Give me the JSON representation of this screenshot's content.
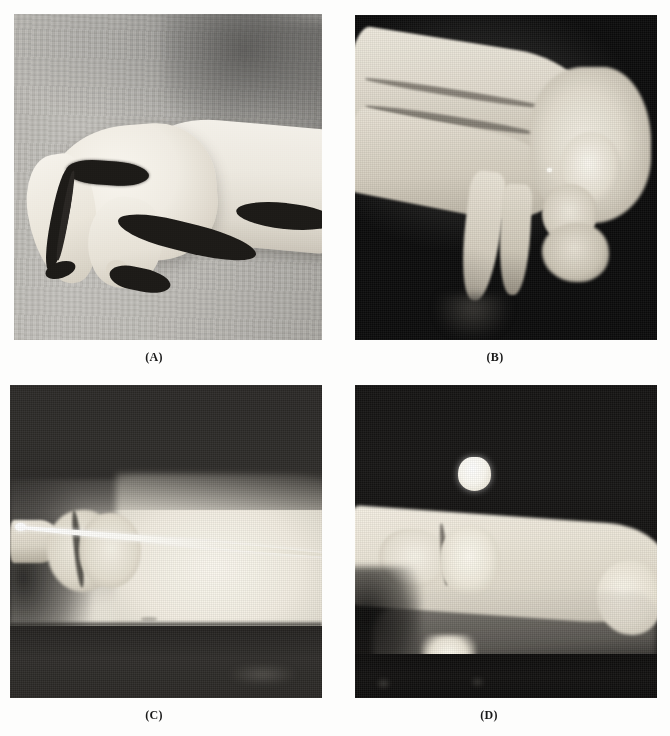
{
  "figure": {
    "background_color": "#fdfdfc",
    "layout": "2x2 panel grid",
    "panels": [
      {
        "id": "a",
        "label": "(A)",
        "kind": "clinical-photograph",
        "description": "Lateral clinical photograph of a hand with flexed digits against a gray cloth background",
        "background_color": "#bcbab5",
        "x": 14,
        "y": 14,
        "width": 308,
        "height": 326,
        "label_x": 154,
        "label_y": 350
      },
      {
        "id": "b",
        "label": "(B)",
        "kind": "radiograph",
        "description": "Lateral radiograph of the hand and wrist on black film background",
        "background_color": "#0b0b0b",
        "x": 355,
        "y": 15,
        "width": 302,
        "height": 325,
        "label_x": 495,
        "label_y": 350
      },
      {
        "id": "c",
        "label": "(C)",
        "kind": "radiograph",
        "description": "Radiograph of a digit with an intramedullary Kirschner wire crossing the joint",
        "background_color": "#2a2826",
        "x": 10,
        "y": 385,
        "width": 312,
        "height": 313,
        "label_x": 154,
        "label_y": 708
      },
      {
        "id": "d",
        "label": "(D)",
        "kind": "radiograph",
        "description": "Radiograph of the same digit after wire removal with a bright radiopaque marker above the bone",
        "background_color": "#121110",
        "x": 355,
        "y": 385,
        "width": 302,
        "height": 313,
        "label_x": 489,
        "label_y": 708
      }
    ]
  }
}
